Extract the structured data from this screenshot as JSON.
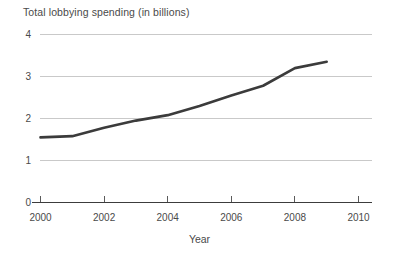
{
  "chart_data": {
    "type": "line",
    "title": "Total lobbying spending (in billions)",
    "xlabel": "Year",
    "ylabel": "",
    "xlim": [
      2000,
      2010
    ],
    "ylim": [
      0,
      4
    ],
    "grid": true,
    "legend": "none",
    "x_ticks": [
      "2000",
      "2002",
      "2004",
      "2006",
      "2008",
      "2010"
    ],
    "x_tick_values": [
      2000,
      2002,
      2004,
      2006,
      2008,
      2010
    ],
    "y_ticks": [
      "0",
      "1",
      "2",
      "3",
      "4"
    ],
    "y_tick_values": [
      0,
      1,
      2,
      3,
      4
    ],
    "line_color": "#3b3b3b",
    "grid_color": "#c9c9c9",
    "axis_color": "#3c3c3c",
    "series": [
      {
        "name": "Total lobbying spending",
        "x": [
          2000,
          2001,
          2002,
          2003,
          2004,
          2005,
          2006,
          2007,
          2008,
          2009
        ],
        "values": [
          1.55,
          1.58,
          1.78,
          1.95,
          2.08,
          2.3,
          2.55,
          2.78,
          3.2,
          3.35
        ]
      }
    ]
  },
  "axis": {
    "y_label_4": "4",
    "y_label_3": "3",
    "y_label_2": "2",
    "y_label_1": "1",
    "y_label_0": "0",
    "x_label_2000": "2000",
    "x_label_2002": "2002",
    "x_label_2004": "2004",
    "x_label_2006": "2006",
    "x_label_2008": "2008",
    "x_label_2010": "2010",
    "x_axis_title": "Year"
  }
}
